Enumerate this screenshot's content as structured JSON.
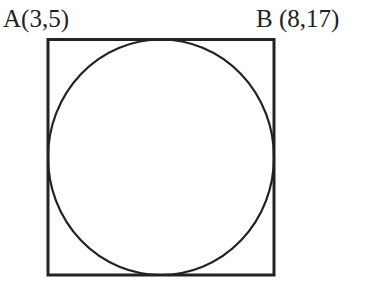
{
  "diagram": {
    "type": "circle-inscribed-in-square",
    "labels": {
      "a": "A(3,5)",
      "b": "B (8,17)"
    },
    "points": [
      {
        "name": "A",
        "x": 3,
        "y": 5,
        "position": "top-left"
      },
      {
        "name": "B",
        "x": 8,
        "y": 17,
        "position": "top-right"
      }
    ],
    "colors": {
      "stroke": "#222222",
      "background": "#ffffff"
    }
  }
}
